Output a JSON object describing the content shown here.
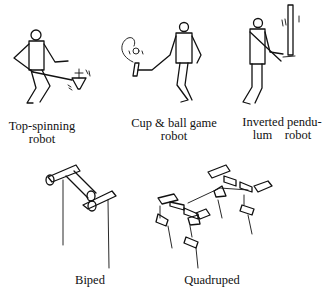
{
  "figures": [
    {
      "id": "top-spinning",
      "caption_line1": "Top-spinning",
      "caption_line2": "robot"
    },
    {
      "id": "cup-ball",
      "caption_line1": "Cup & ball game",
      "caption_line2": "robot"
    },
    {
      "id": "inverted-pendulum",
      "caption_line1": "Inverted pendu-",
      "caption_line2": "lum    robot"
    },
    {
      "id": "biped",
      "caption_line1": "Biped"
    },
    {
      "id": "quadruped",
      "caption_line1": "Quadruped"
    }
  ]
}
